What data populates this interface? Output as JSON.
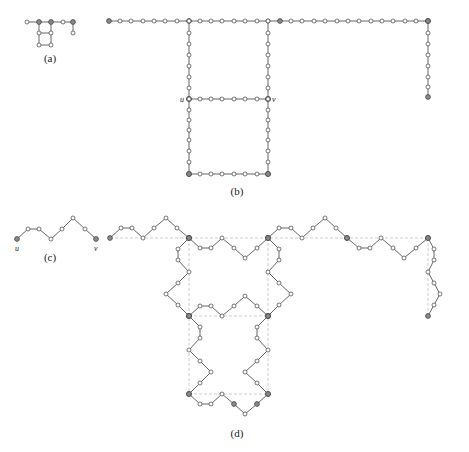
{
  "figure": {
    "width": 469,
    "height": 452,
    "colors": {
      "edge": "#555555",
      "guide": "#b8b8b8",
      "node_fill": "#ffffff",
      "key_node_fill": "#8a8a8a"
    }
  },
  "panels": [
    {
      "id": "a",
      "caption": "(a)",
      "caption_pos": [
        50,
        62
      ],
      "nodes": [
        [
          27,
          22,
          0
        ],
        [
          39,
          22,
          1
        ],
        [
          51,
          22,
          1
        ],
        [
          63,
          22,
          0
        ],
        [
          73,
          22,
          1
        ],
        [
          73,
          33,
          0
        ],
        [
          39,
          33,
          0
        ],
        [
          51,
          33,
          0
        ],
        [
          39,
          45,
          0
        ],
        [
          51,
          45,
          0
        ]
      ],
      "edges": [
        [
          0,
          1
        ],
        [
          1,
          2
        ],
        [
          2,
          3
        ],
        [
          3,
          4
        ],
        [
          4,
          5
        ],
        [
          1,
          6
        ],
        [
          2,
          7
        ],
        [
          6,
          7
        ],
        [
          6,
          8
        ],
        [
          7,
          9
        ],
        [
          8,
          9
        ]
      ],
      "guides": [],
      "labels": []
    },
    {
      "id": "b",
      "caption": "(b)",
      "caption_pos": [
        237,
        195
      ],
      "paths": [
        {
          "name": "top-row",
          "points": [
            [
              109,
              21
            ],
            [
              120,
              21
            ],
            [
              131,
              21
            ],
            [
              143,
              21
            ],
            [
              154,
              21
            ],
            [
              165,
              21
            ],
            [
              177,
              21
            ],
            [
              189,
              21
            ],
            [
              200,
              21
            ],
            [
              211,
              21
            ],
            [
              222,
              21
            ],
            [
              234,
              21
            ],
            [
              245,
              21
            ],
            [
              257,
              21
            ],
            [
              268,
              21
            ],
            [
              280,
              21
            ],
            [
              291,
              21
            ],
            [
              302,
              21
            ],
            [
              314,
              21
            ],
            [
              325,
              21
            ],
            [
              337,
              21
            ],
            [
              348,
              21
            ],
            [
              359,
              21
            ],
            [
              371,
              21
            ],
            [
              382,
              21
            ],
            [
              393,
              21
            ],
            [
              405,
              21
            ],
            [
              416,
              21
            ],
            [
              428,
              21
            ]
          ],
          "keys": [
            0,
            7,
            15,
            28
          ]
        },
        {
          "name": "right-tail",
          "points": [
            [
              428,
              21
            ],
            [
              428,
              33
            ],
            [
              428,
              44
            ],
            [
              428,
              55
            ],
            [
              428,
              66
            ],
            [
              428,
              77
            ],
            [
              428,
              87
            ],
            [
              428,
              97
            ]
          ],
          "keys": [
            0,
            7
          ]
        },
        {
          "name": "left-upper",
          "points": [
            [
              189,
              21
            ],
            [
              189,
              33
            ],
            [
              189,
              44
            ],
            [
              189,
              55
            ],
            [
              189,
              66
            ],
            [
              189,
              77
            ],
            [
              189,
              88
            ],
            [
              189,
              99
            ]
          ],
          "keys": [
            7
          ]
        },
        {
          "name": "right-upper",
          "points": [
            [
              268,
              21
            ],
            [
              268,
              33
            ],
            [
              268,
              44
            ],
            [
              268,
              55
            ],
            [
              268,
              66
            ],
            [
              268,
              77
            ],
            [
              268,
              88
            ],
            [
              268,
              99
            ]
          ],
          "keys": [
            7
          ]
        },
        {
          "name": "uv-row",
          "points": [
            [
              189,
              99
            ],
            [
              200,
              99
            ],
            [
              211,
              99
            ],
            [
              222,
              99
            ],
            [
              234,
              99
            ],
            [
              245,
              99
            ],
            [
              257,
              99
            ],
            [
              268,
              99
            ]
          ],
          "keys": [
            0,
            7
          ]
        },
        {
          "name": "left-lower",
          "points": [
            [
              189,
              99
            ],
            [
              189,
              110
            ],
            [
              189,
              120
            ],
            [
              189,
              130
            ],
            [
              189,
              140
            ],
            [
              189,
              151
            ],
            [
              189,
              162
            ],
            [
              189,
              174
            ]
          ],
          "keys": [
            7
          ]
        },
        {
          "name": "right-lower",
          "points": [
            [
              268,
              99
            ],
            [
              268,
              110
            ],
            [
              268,
              120
            ],
            [
              268,
              130
            ],
            [
              268,
              140
            ],
            [
              268,
              151
            ],
            [
              268,
              162
            ],
            [
              268,
              174
            ]
          ],
          "keys": [
            7
          ]
        },
        {
          "name": "bottom-row",
          "points": [
            [
              189,
              174
            ],
            [
              200,
              174
            ],
            [
              211,
              174
            ],
            [
              222,
              174
            ],
            [
              234,
              174
            ],
            [
              245,
              174
            ],
            [
              257,
              174
            ],
            [
              268,
              174
            ]
          ],
          "keys": [
            0,
            7
          ]
        }
      ],
      "labels": [
        {
          "text": "u",
          "pos": [
            180,
            102
          ]
        },
        {
          "text": "v",
          "pos": [
            272,
            102
          ]
        }
      ]
    },
    {
      "id": "c",
      "caption": "(c)",
      "caption_pos": [
        50,
        261
      ],
      "paths": [
        {
          "name": "uv-path",
          "points": [
            [
              17,
              239
            ],
            [
              28,
              229
            ],
            [
              39,
              229
            ],
            [
              51,
              239
            ],
            [
              62,
              229
            ],
            [
              73,
              218
            ],
            [
              85,
              229
            ],
            [
              96,
              239
            ]
          ],
          "keys": [
            0,
            7
          ]
        }
      ],
      "labels": [
        {
          "text": "u",
          "pos": [
            15,
            251
          ]
        },
        {
          "text": "v",
          "pos": [
            94,
            251
          ]
        }
      ]
    },
    {
      "id": "d",
      "caption": "(d)",
      "caption_pos": [
        237,
        437
      ],
      "paths": [
        {
          "name": "top-left-segment",
          "points": [
            [
              110,
              238
            ],
            [
              121,
              228
            ],
            [
              132,
              228
            ],
            [
              143,
              238
            ],
            [
              154,
              228
            ],
            [
              166,
              218
            ],
            [
              177,
              228
            ],
            [
              189,
              238
            ]
          ],
          "keys": [
            0,
            7
          ]
        },
        {
          "name": "top-middle-segment",
          "points": [
            [
              189,
              238
            ],
            [
              200,
              248
            ],
            [
              211,
              248
            ],
            [
              222,
              238
            ],
            [
              234,
              248
            ],
            [
              245,
              258
            ],
            [
              257,
              248
            ],
            [
              268,
              238
            ]
          ],
          "keys": [
            0,
            7
          ]
        },
        {
          "name": "top-right-a",
          "points": [
            [
              268,
              238
            ],
            [
              279,
              228
            ],
            [
              291,
              228
            ],
            [
              302,
              238
            ],
            [
              313,
              228
            ],
            [
              325,
              218
            ],
            [
              336,
              228
            ],
            [
              347,
              238
            ]
          ],
          "keys": [
            0,
            7
          ]
        },
        {
          "name": "top-right-b",
          "points": [
            [
              347,
              238
            ],
            [
              359,
              248
            ],
            [
              370,
              248
            ],
            [
              381,
              238
            ],
            [
              393,
              248
            ],
            [
              404,
              258
            ],
            [
              416,
              248
            ],
            [
              428,
              238
            ]
          ],
          "keys": [
            0,
            7
          ]
        },
        {
          "name": "right-tail",
          "points": [
            [
              428,
              238
            ],
            [
              434,
              249
            ],
            [
              434,
              260
            ],
            [
              428,
              272
            ],
            [
              434,
              283
            ],
            [
              440,
              294
            ],
            [
              434,
              305
            ],
            [
              428,
              316
            ]
          ],
          "keys": [
            0,
            7
          ]
        },
        {
          "name": "left-upper",
          "points": [
            [
              189,
              238
            ],
            [
              178,
              249
            ],
            [
              178,
              260
            ],
            [
              189,
              272
            ],
            [
              178,
              283
            ],
            [
              166,
              294
            ],
            [
              178,
              305
            ],
            [
              189,
              316
            ]
          ],
          "keys": [
            0,
            7
          ]
        },
        {
          "name": "right-upper",
          "points": [
            [
              268,
              238
            ],
            [
              279,
              249
            ],
            [
              279,
              260
            ],
            [
              268,
              272
            ],
            [
              279,
              283
            ],
            [
              291,
              294
            ],
            [
              279,
              305
            ],
            [
              268,
              316
            ]
          ],
          "keys": [
            0,
            7
          ]
        },
        {
          "name": "uv-segment",
          "points": [
            [
              189,
              316
            ],
            [
              200,
              306
            ],
            [
              211,
              306
            ],
            [
              222,
              316
            ],
            [
              234,
              306
            ],
            [
              245,
              296
            ],
            [
              257,
              306
            ],
            [
              268,
              316
            ]
          ],
          "keys": [
            0,
            7
          ]
        },
        {
          "name": "left-lower",
          "points": [
            [
              189,
              316
            ],
            [
              200,
              327
            ],
            [
              200,
              338
            ],
            [
              189,
              350
            ],
            [
              200,
              361
            ],
            [
              211,
              372
            ],
            [
              200,
              383
            ],
            [
              189,
              394
            ]
          ],
          "keys": [
            0,
            7
          ]
        },
        {
          "name": "right-lower",
          "points": [
            [
              268,
              316
            ],
            [
              257,
              327
            ],
            [
              257,
              338
            ],
            [
              268,
              350
            ],
            [
              257,
              361
            ],
            [
              245,
              372
            ],
            [
              257,
              383
            ],
            [
              268,
              394
            ]
          ],
          "keys": [
            0,
            7
          ]
        },
        {
          "name": "bottom-segment",
          "points": [
            [
              189,
              394
            ],
            [
              200,
              404
            ],
            [
              211,
              404
            ],
            [
              222,
              394
            ],
            [
              234,
              404
            ],
            [
              245,
              414
            ],
            [
              257,
              404
            ],
            [
              268,
              394
            ]
          ],
          "keys": [
            0,
            4,
            6,
            7
          ]
        }
      ],
      "guides": [
        [
          [
            110,
            238
          ],
          [
            428,
            238
          ]
        ],
        [
          [
            189,
            316
          ],
          [
            268,
            316
          ]
        ],
        [
          [
            189,
            394
          ],
          [
            268,
            394
          ]
        ],
        [
          [
            189,
            238
          ],
          [
            189,
            394
          ]
        ],
        [
          [
            268,
            238
          ],
          [
            268,
            394
          ]
        ],
        [
          [
            428,
            238
          ],
          [
            428,
            316
          ]
        ]
      ],
      "labels": []
    }
  ]
}
